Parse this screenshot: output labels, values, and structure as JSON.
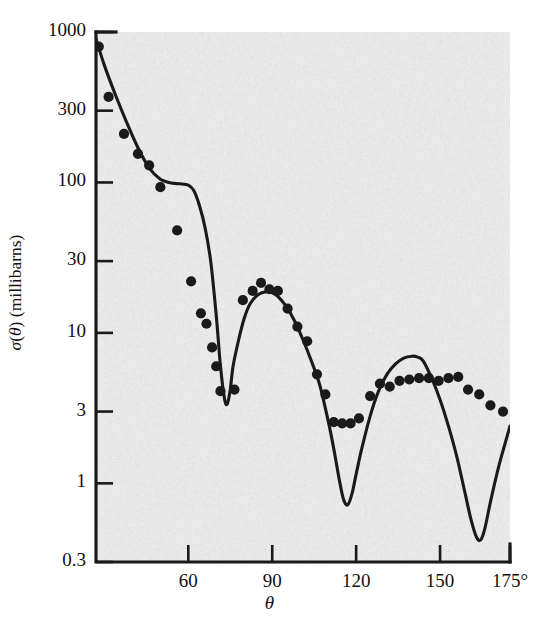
{
  "figure": {
    "type": "scatter-with-curve",
    "background_color": "#f1f1f1",
    "ink_color": "#1a1a1a",
    "axis_label_x": "θ",
    "axis_label_y_prefix": "σ(θ)",
    "axis_label_y": "σ(θ) (millibarns)",
    "axis_label_y_units": "(millibarns)"
  },
  "yaxis": {
    "scale": "log",
    "label": "σ(θ) (millibarns)",
    "min": 0.3,
    "max": 1000,
    "ticks": [
      {
        "value": 1000,
        "label": "1000"
      },
      {
        "value": 300,
        "label": "300"
      },
      {
        "value": 100,
        "label": "100"
      },
      {
        "value": 30,
        "label": "30"
      },
      {
        "value": 10,
        "label": "10"
      },
      {
        "value": 3,
        "label": "3"
      },
      {
        "value": 1,
        "label": "1"
      },
      {
        "value": 0.3,
        "label": "0.3"
      }
    ]
  },
  "xaxis": {
    "scale": "linear",
    "label": "θ",
    "min": 27,
    "max": 175,
    "ticks": [
      {
        "value": 60,
        "label": "60"
      },
      {
        "value": 90,
        "label": "90"
      },
      {
        "value": 120,
        "label": "120"
      },
      {
        "value": 150,
        "label": "150"
      },
      {
        "value": 175,
        "label": "175°"
      }
    ]
  },
  "chart_data": {
    "type": "scatter",
    "title": "",
    "xlabel": "θ",
    "ylabel": "σ(θ) (millibarns)",
    "xlim": [
      27,
      175
    ],
    "ylim": [
      0.3,
      1000
    ],
    "yscale": "log",
    "grid": false,
    "legend": "none",
    "series": [
      {
        "name": "measured data points",
        "type": "scatter",
        "marker": "filled-circle",
        "x": [
          28,
          31.5,
          37,
          42,
          46,
          50,
          56,
          61,
          64.5,
          66.5,
          68.5,
          70,
          71.5,
          76.5,
          79.5,
          83,
          86,
          89,
          92,
          95.5,
          99,
          102.5,
          106,
          109,
          112,
          115,
          118,
          121,
          125,
          128.5,
          132,
          135.5,
          139,
          142.5,
          146,
          149.5,
          153,
          156.5,
          160,
          164,
          168,
          172.5
        ],
        "y": [
          800,
          370,
          210,
          155,
          130,
          93,
          48,
          22,
          13.5,
          11.5,
          8.0,
          6.0,
          4.1,
          4.2,
          16.5,
          19.0,
          21.5,
          19.5,
          19.0,
          14.5,
          11.0,
          8.8,
          5.3,
          3.9,
          2.55,
          2.5,
          2.5,
          2.7,
          3.8,
          4.6,
          4.4,
          4.8,
          4.9,
          5.0,
          5.0,
          4.8,
          5.0,
          5.1,
          4.2,
          3.9,
          3.3,
          3.0
        ]
      },
      {
        "name": "theoretical curve",
        "type": "line",
        "x": [
          27,
          30,
          34,
          38,
          42,
          46,
          50,
          54,
          57,
          60,
          62,
          64,
          66,
          68,
          70,
          71.5,
          73,
          74,
          75,
          76,
          78,
          80,
          82,
          85,
          88,
          90,
          92,
          95,
          98,
          101,
          104,
          107,
          110,
          112,
          114,
          115.5,
          117,
          118.5,
          120,
          122,
          125,
          128,
          131,
          134,
          137,
          140,
          142,
          144,
          147,
          150,
          153,
          156,
          159,
          161,
          163,
          164.5,
          166,
          168,
          171,
          175
        ],
        "y": [
          900,
          600,
          380,
          250,
          170,
          125,
          105,
          99,
          98,
          96,
          88,
          70,
          50,
          30,
          13,
          6.0,
          3.6,
          3.4,
          4.2,
          6.0,
          9.0,
          12.5,
          15.5,
          18.0,
          18.8,
          18.5,
          17.5,
          15.0,
          12.0,
          9.0,
          6.5,
          4.5,
          2.6,
          1.7,
          1.05,
          0.78,
          0.72,
          0.85,
          1.15,
          1.7,
          2.8,
          4.1,
          5.3,
          6.2,
          6.8,
          7.0,
          6.9,
          6.5,
          5.0,
          3.6,
          2.4,
          1.5,
          0.85,
          0.58,
          0.44,
          0.42,
          0.5,
          0.75,
          1.3,
          2.4
        ]
      }
    ]
  }
}
